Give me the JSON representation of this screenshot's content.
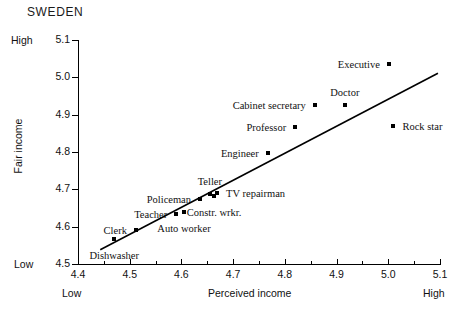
{
  "chart_data": {
    "type": "scatter",
    "title": "SWEDEN",
    "xlabel": "Perceived income",
    "ylabel": "Fair income",
    "xlim": [
      4.4,
      5.1
    ],
    "ylim": [
      4.5,
      5.1
    ],
    "grid": false,
    "legend": "none",
    "x_axis_low_label": "Low",
    "x_axis_high_label": "High",
    "y_axis_low_label": "Low",
    "y_axis_high_label": "High",
    "xticks": [
      "4.4",
      "4.5",
      "4.6",
      "4.7",
      "4.8",
      "4.9",
      "5.0",
      "5.1"
    ],
    "xtick_values": [
      4.4,
      4.5,
      4.6,
      4.7,
      4.8,
      4.9,
      5.0,
      5.1
    ],
    "yticks": [
      "4.5",
      "4.6",
      "4.7",
      "4.8",
      "4.9",
      "5.0",
      "5.1"
    ],
    "ytick_values": [
      4.5,
      4.6,
      4.7,
      4.8,
      4.9,
      5.0,
      5.1
    ],
    "points": [
      {
        "label": "Dishwasher",
        "x": 4.47,
        "y": 4.568,
        "label_pos": "below"
      },
      {
        "label": "Clerk",
        "x": 4.512,
        "y": 4.59,
        "label_pos": "left"
      },
      {
        "label": "Teacher",
        "x": 4.59,
        "y": 4.633,
        "label_pos": "left"
      },
      {
        "label": "Policeman",
        "x": 4.636,
        "y": 4.673,
        "label_pos": "left"
      },
      {
        "label": "Auto worker",
        "x": 4.605,
        "y": 4.64,
        "label_pos": "below"
      },
      {
        "label": "Teller",
        "x": 4.655,
        "y": 4.688,
        "label_pos": "above"
      },
      {
        "label": "Constr. wrkr.",
        "x": 4.663,
        "y": 4.683,
        "label_pos": "below"
      },
      {
        "label": "TV repairman",
        "x": 4.669,
        "y": 4.69,
        "label_pos": "right"
      },
      {
        "label": "Engineer",
        "x": 4.767,
        "y": 4.797,
        "label_pos": "left"
      },
      {
        "label": "Professor",
        "x": 4.82,
        "y": 4.866,
        "label_pos": "left"
      },
      {
        "label": "Cabinet secretary",
        "x": 4.858,
        "y": 4.927,
        "label_pos": "left"
      },
      {
        "label": "Doctor",
        "x": 4.916,
        "y": 4.926,
        "label_pos": "above"
      },
      {
        "label": "Executive",
        "x": 5.001,
        "y": 5.037,
        "label_pos": "left"
      },
      {
        "label": "Rock star",
        "x": 5.01,
        "y": 4.87,
        "label_pos": "right"
      }
    ],
    "fit_line": {
      "name": "regression line",
      "x_start": 4.443,
      "y_start": 4.538,
      "x_end": 5.096,
      "y_end": 5.011
    },
    "colors": {
      "axis": "#000000",
      "marker": "#000000",
      "line": "#000000",
      "background": "#ffffff",
      "text": "#111111"
    }
  }
}
